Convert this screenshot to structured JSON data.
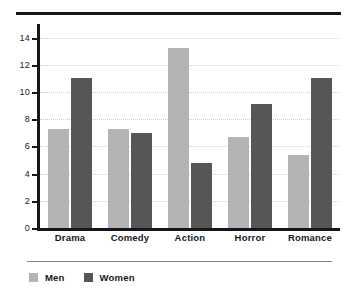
{
  "chart_data": {
    "type": "bar",
    "title": "",
    "subtitle": "",
    "xlabel": "",
    "ylabel": "",
    "categories": [
      "Drama",
      "Comedy",
      "Action",
      "Horror",
      "Romance"
    ],
    "series": [
      {
        "name": "Men",
        "color": "#b4b4b4",
        "values": [
          7.25,
          7.25,
          13.2,
          6.7,
          5.4
        ]
      },
      {
        "name": "Women",
        "color": "#565656",
        "values": [
          11.0,
          7.0,
          4.8,
          9.1,
          11.0
        ]
      }
    ],
    "ylim": [
      0,
      15
    ],
    "yticks": [
      0,
      2,
      4,
      6,
      8,
      10,
      12,
      14
    ],
    "ytick_labels": [
      "0",
      "2",
      "4",
      "6",
      "8",
      "10",
      "12",
      "14"
    ],
    "grid": true,
    "grid_axis": "y",
    "legend_position": "bottom-left"
  },
  "legend": {
    "items": [
      {
        "label": "Men",
        "color": "#b4b4b4"
      },
      {
        "label": "Women",
        "color": "#565656"
      }
    ]
  }
}
